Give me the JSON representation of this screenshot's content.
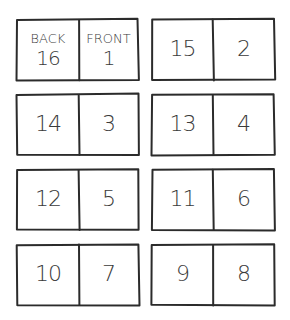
{
  "labels": {
    "back": "BACK",
    "front": "FRONT"
  },
  "sheets": [
    {
      "left": {
        "page": "16",
        "label": "BACK"
      },
      "right": {
        "page": "1",
        "label": "FRONT"
      }
    },
    {
      "left": {
        "page": "15"
      },
      "right": {
        "page": "2"
      }
    },
    {
      "left": {
        "page": "14"
      },
      "right": {
        "page": "3"
      }
    },
    {
      "left": {
        "page": "13"
      },
      "right": {
        "page": "4"
      }
    },
    {
      "left": {
        "page": "12"
      },
      "right": {
        "page": "5"
      }
    },
    {
      "left": {
        "page": "11"
      },
      "right": {
        "page": "6"
      }
    },
    {
      "left": {
        "page": "10"
      },
      "right": {
        "page": "7"
      }
    },
    {
      "left": {
        "page": "9"
      },
      "right": {
        "page": "8"
      }
    }
  ],
  "colors": {
    "ink": "#2b2b2b",
    "text": "#3a3a3a",
    "background": "#ffffff"
  }
}
